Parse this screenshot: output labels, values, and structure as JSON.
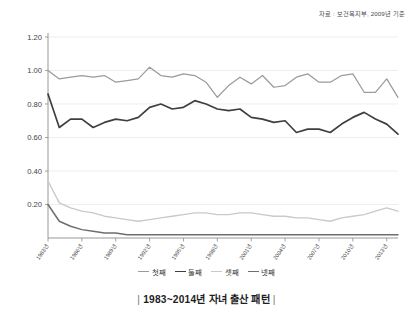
{
  "source_note": "자료 : 보건복지부, 2009년 기준",
  "caption": {
    "bar_left": "|",
    "text": "1983~2014년 자녀 출산 패턴",
    "bar_right": "|"
  },
  "legend": {
    "position": "bottom-center",
    "items": [
      {
        "label": "첫째",
        "color": "#9b9b9b"
      },
      {
        "label": "둘째",
        "color": "#3f3f3f"
      },
      {
        "label": "셋째",
        "color": "#c9c9c9"
      },
      {
        "label": "넷째",
        "color": "#6e6e6e"
      }
    ]
  },
  "axes": {
    "y_ticks": [
      "0.00",
      "0.20",
      "0.40",
      "0.60",
      "0.80",
      "1.00",
      "1.20"
    ],
    "y_tick_labels_shown": [
      "0.20",
      "0.40",
      "0.60",
      "0.80",
      "1.00",
      "1.20"
    ],
    "x_tick_labels": [
      "1983년",
      "1986년",
      "1989년",
      "1992년",
      "1995년",
      "1998년",
      "2001년",
      "2004년",
      "2007년",
      "2010년",
      "2013년"
    ]
  },
  "chart_data": {
    "type": "line",
    "title": "1983~2014년 자녀 출산 패턴",
    "subtitle": "자료 : 보건복지부, 2009년 기준",
    "xlabel": "",
    "ylabel": "",
    "ylim": [
      0.0,
      1.2
    ],
    "grid": true,
    "legend_position": "bottom-center",
    "x": [
      1983,
      1984,
      1985,
      1986,
      1987,
      1988,
      1989,
      1990,
      1991,
      1992,
      1993,
      1994,
      1995,
      1996,
      1997,
      1998,
      1999,
      2000,
      2001,
      2002,
      2003,
      2004,
      2005,
      2006,
      2007,
      2008,
      2009,
      2010,
      2011,
      2012,
      2013,
      2014
    ],
    "categories": [
      "1983년",
      "1984년",
      "1985년",
      "1986년",
      "1987년",
      "1988년",
      "1989년",
      "1990년",
      "1991년",
      "1992년",
      "1993년",
      "1994년",
      "1995년",
      "1996년",
      "1997년",
      "1998년",
      "1999년",
      "2000년",
      "2001년",
      "2002년",
      "2003년",
      "2004년",
      "2005년",
      "2006년",
      "2007년",
      "2008년",
      "2009년",
      "2010년",
      "2011년",
      "2012년",
      "2013년",
      "2014년"
    ],
    "series": [
      {
        "name": "첫째",
        "color": "#9b9b9b",
        "values": [
          1.0,
          0.95,
          0.96,
          0.97,
          0.96,
          0.97,
          0.93,
          0.94,
          0.95,
          1.02,
          0.97,
          0.96,
          0.98,
          0.97,
          0.93,
          0.84,
          0.91,
          0.96,
          0.92,
          0.97,
          0.9,
          0.91,
          0.96,
          0.98,
          0.93,
          0.93,
          0.97,
          0.98,
          0.87,
          0.87,
          0.95,
          0.84
        ]
      },
      {
        "name": "둘째",
        "color": "#3f3f3f",
        "values": [
          0.86,
          0.66,
          0.71,
          0.71,
          0.66,
          0.69,
          0.71,
          0.7,
          0.72,
          0.78,
          0.8,
          0.77,
          0.78,
          0.82,
          0.8,
          0.77,
          0.76,
          0.77,
          0.72,
          0.71,
          0.69,
          0.7,
          0.63,
          0.65,
          0.65,
          0.63,
          0.68,
          0.72,
          0.75,
          0.71,
          0.68,
          0.62
        ]
      },
      {
        "name": "셋째",
        "color": "#c9c9c9",
        "values": [
          0.34,
          0.21,
          0.18,
          0.16,
          0.15,
          0.13,
          0.12,
          0.11,
          0.1,
          0.11,
          0.12,
          0.13,
          0.14,
          0.15,
          0.15,
          0.14,
          0.14,
          0.15,
          0.15,
          0.14,
          0.13,
          0.13,
          0.12,
          0.12,
          0.11,
          0.1,
          0.12,
          0.13,
          0.14,
          0.16,
          0.18,
          0.16
        ]
      },
      {
        "name": "넷째",
        "color": "#6e6e6e",
        "values": [
          0.2,
          0.1,
          0.07,
          0.05,
          0.04,
          0.03,
          0.03,
          0.02,
          0.02,
          0.02,
          0.02,
          0.02,
          0.02,
          0.02,
          0.02,
          0.02,
          0.02,
          0.02,
          0.02,
          0.02,
          0.02,
          0.02,
          0.02,
          0.02,
          0.02,
          0.02,
          0.02,
          0.02,
          0.02,
          0.02,
          0.02,
          0.02
        ]
      }
    ]
  }
}
